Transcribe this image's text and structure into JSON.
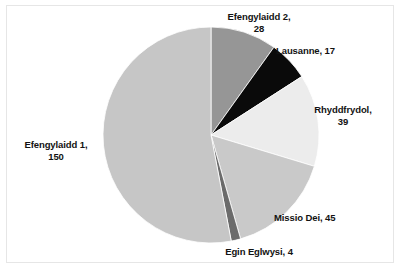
{
  "chart_data": {
    "type": "pie",
    "title": "",
    "subtitle": "",
    "xlabel": "",
    "ylabel": "",
    "legend_position": "none",
    "grid": false,
    "total": 283,
    "start_angle_deg": 0,
    "direction": "clockwise",
    "categories": [
      "Efengylaidd 2",
      "Lausanne",
      "Rhyddfrydol",
      "Missio Dei",
      "Egin Eglwysi",
      "Efengylaidd 1"
    ],
    "values": [
      28,
      17,
      39,
      45,
      4,
      150
    ],
    "slices": [
      {
        "label": "Efengylaidd 2",
        "value": 28,
        "label_text": "Efengylaidd 2,\n28",
        "color": "#969696",
        "percent": 9.9,
        "start_angle_deg": 0,
        "end_angle_deg": 35.6
      },
      {
        "label": "Lausanne",
        "value": 17,
        "label_text": "Lausanne, 17",
        "color": "#0a0a0a",
        "percent": 6.0,
        "start_angle_deg": 35.6,
        "end_angle_deg": 57.3
      },
      {
        "label": "Rhyddfrydol",
        "value": 39,
        "label_text": "Rhyddfrydol,\n39",
        "color": "#ececec",
        "percent": 13.8,
        "start_angle_deg": 57.3,
        "end_angle_deg": 106.9
      },
      {
        "label": "Missio Dei",
        "value": 45,
        "label_text": "Missio Dei, 45",
        "color": "#c9c9c9",
        "percent": 15.9,
        "start_angle_deg": 106.9,
        "end_angle_deg": 164.2
      },
      {
        "label": "Egin Eglwysi",
        "value": 4,
        "label_text": "Egin Eglwysi, 4",
        "color": "#6b6b6b",
        "percent": 1.4,
        "start_angle_deg": 164.2,
        "end_angle_deg": 169.3
      },
      {
        "label": "Efengylaidd 1",
        "value": 150,
        "label_text": "Efengylaidd 1,\n150",
        "color": "#c6c6c6",
        "percent": 53.0,
        "start_angle_deg": 169.3,
        "end_angle_deg": 360
      }
    ],
    "geometry": {
      "center_x": 211,
      "center_y": 135,
      "radius": 108
    },
    "colors": {
      "background": "#ffffff",
      "border": "#e6e6e6",
      "slice_outline": "#ffffff",
      "label_text": "#121212"
    }
  }
}
